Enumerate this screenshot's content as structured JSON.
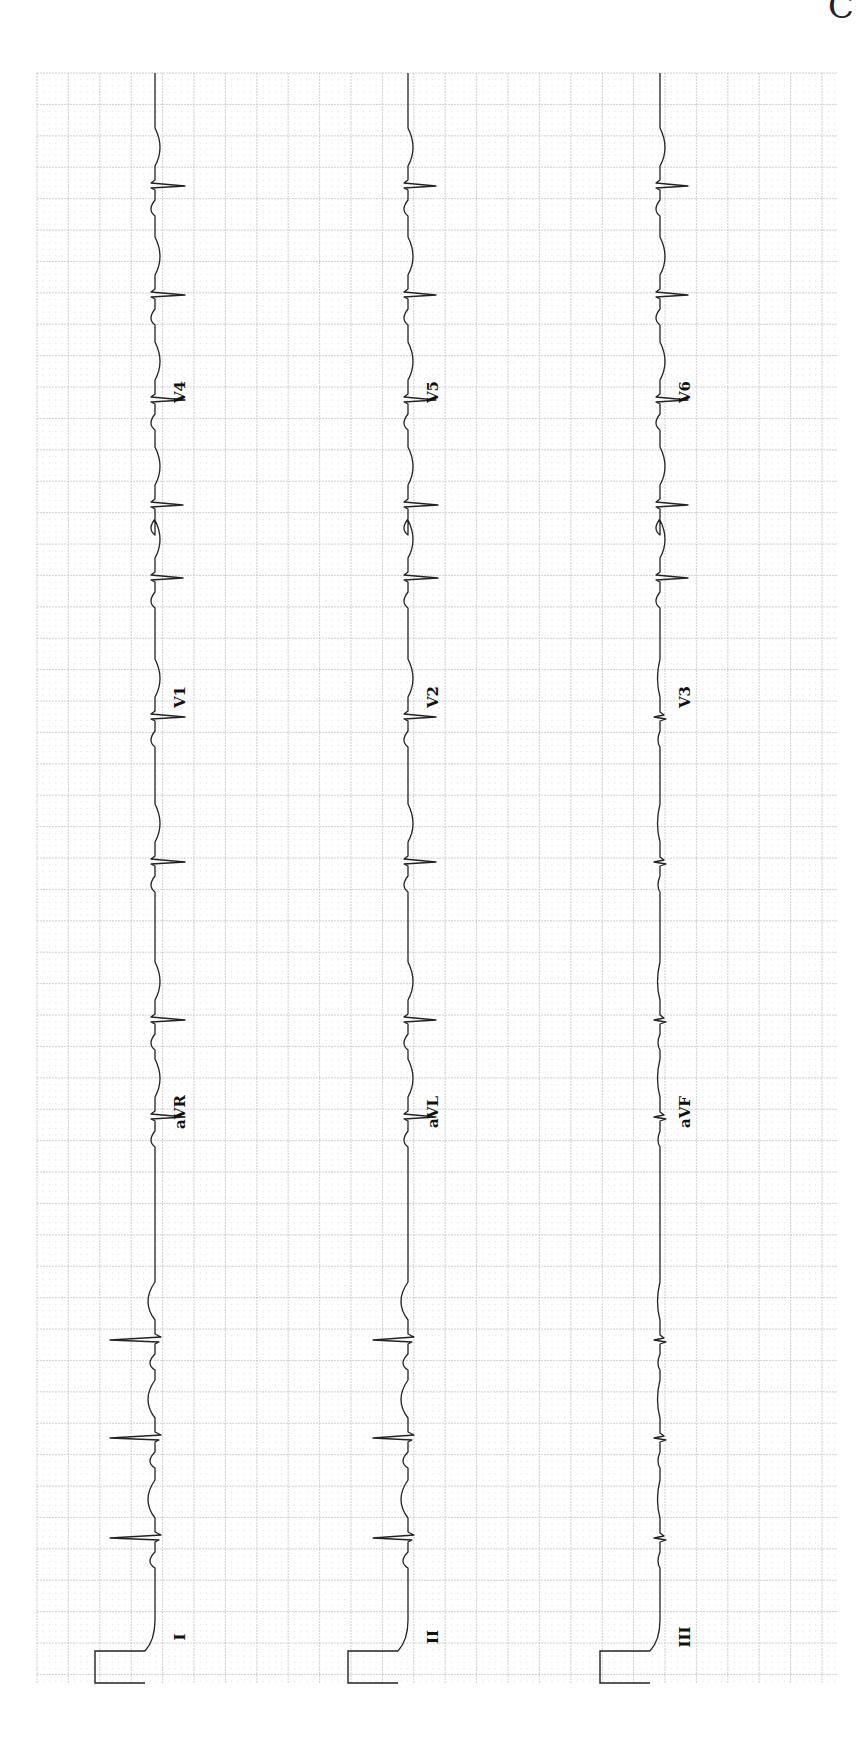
{
  "page": {
    "corner_letter": "C",
    "orientation": "rotated 90deg clockwise; time axis runs bottom-to-top"
  },
  "grid": {
    "left": 37,
    "top": 73,
    "right": 838,
    "bottom": 1683,
    "major_spacing": 31.4,
    "minor_divisions": 5,
    "major_color": "#c8c8c8",
    "minor_color": "#d6d6d6"
  },
  "trace_color": "#222222",
  "calibration": {
    "label": "1 mV calibration pulse"
  },
  "rows": [
    {
      "baseline_x": 155,
      "leads": [
        {
          "name": "I",
          "label_y": 1637
        },
        {
          "name": "aVR",
          "label_y": 1112
        },
        {
          "name": "V1",
          "label_y": 697
        },
        {
          "name": "V4",
          "label_y": 392
        }
      ]
    },
    {
      "baseline_x": 408,
      "leads": [
        {
          "name": "II",
          "label_y": 1637
        },
        {
          "name": "aVL",
          "label_y": 1112
        },
        {
          "name": "V2",
          "label_y": 697
        },
        {
          "name": "V5",
          "label_y": 392
        }
      ]
    },
    {
      "baseline_x": 660,
      "leads": [
        {
          "name": "III",
          "label_y": 1637
        },
        {
          "name": "aVF",
          "label_y": 1112
        },
        {
          "name": "V3",
          "label_y": 697
        },
        {
          "name": "V6",
          "label_y": 392
        }
      ]
    }
  ],
  "beats_y": [
    1538,
    1438,
    1340,
    1117,
    1020,
    862,
    717,
    578,
    505,
    400,
    295,
    186
  ]
}
